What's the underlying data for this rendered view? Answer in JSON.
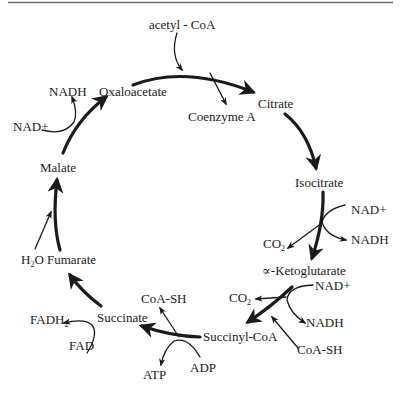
{
  "colors": {
    "ink": "#1a1a1a",
    "rule": "#6e6e6e",
    "background": "#ffffff"
  },
  "input": {
    "acetyl_coa": "acetyl - CoA"
  },
  "intermediates": {
    "oxaloacetate": "Oxaloacetate",
    "citrate": "Citrate",
    "isocitrate": "Isocitrate",
    "alpha_ketoglutarate": "∝-Ketoglutarate",
    "succinyl_coa": "Succinyl-CoA",
    "succinate": "Succinate",
    "fumarate": "Fumarate",
    "malate": "Malate"
  },
  "side_products": {
    "coenzyme_a": "Coenzyme A",
    "iso_nad_plus": "NAD+",
    "iso_nadh": "NADH",
    "iso_co2_main": "CO",
    "iso_co2_sub": "2",
    "akg_nad_plus": "NAD+",
    "akg_nadh": "NADH",
    "akg_co2_main": "CO",
    "akg_co2_sub": "2",
    "akg_coash": "CoA-SH",
    "succ_coash": "CoA-SH",
    "adp": "ADP",
    "atp": "ATP",
    "fad": "FAD",
    "fadh2_main": "FADH",
    "fadh2_sub": "2",
    "h2o_h": "H",
    "h2o_sub": "2",
    "h2o_o": "O",
    "mal_nad_plus": "NAD+",
    "mal_nadh": "NADH"
  }
}
